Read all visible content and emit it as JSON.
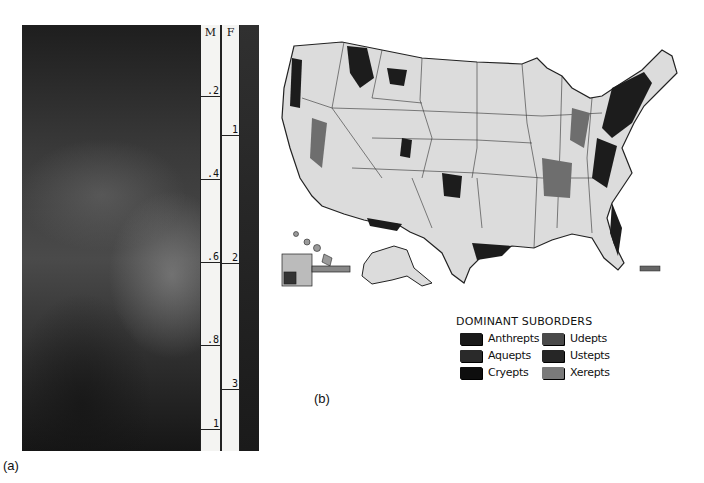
{
  "figure": {
    "panel_a": {
      "label": "(a)",
      "tape": {
        "column_m_header": "M",
        "column_f_header": "F",
        "m_ticks": [
          ".2",
          ".4",
          ".6",
          ".8",
          "1"
        ],
        "f_ticks": [
          "1",
          "2",
          "3"
        ]
      }
    },
    "panel_b": {
      "label": "(b)",
      "map_title": "Dominant suborders of Inceptisols, United States",
      "legend": {
        "title": "DOMINANT SUBORDERS",
        "items": [
          {
            "label": "Anthrepts",
            "color": "#1a1a1a"
          },
          {
            "label": "Udepts",
            "color": "#4a4a4a"
          },
          {
            "label": "Aquepts",
            "color": "#2a2a2a"
          },
          {
            "label": "Ustepts",
            "color": "#262626"
          },
          {
            "label": "Cryepts",
            "color": "#0e0e0e"
          },
          {
            "label": "Xerepts",
            "color": "#7a7a7a"
          }
        ]
      }
    }
  }
}
